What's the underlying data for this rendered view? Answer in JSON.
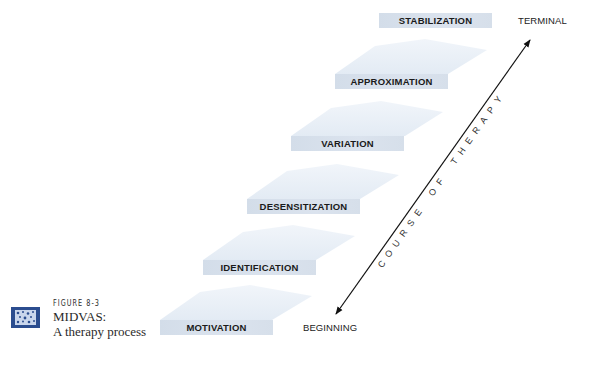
{
  "figure": {
    "number": "FIGURE 8-3",
    "title": "MIDVAS:",
    "subtitle": "A therapy process",
    "icon": "figure-pattern-icon"
  },
  "steps": [
    {
      "label": "MOTIVATION",
      "order": 1
    },
    {
      "label": "IDENTIFICATION",
      "order": 2
    },
    {
      "label": "DESENSITIZATION",
      "order": 3
    },
    {
      "label": "VARIATION",
      "order": 4
    },
    {
      "label": "APPROXIMATION",
      "order": 5
    },
    {
      "label": "STABILIZATION",
      "order": 6
    }
  ],
  "axis": {
    "start_label": "BEGINNING",
    "end_label": "TERMINAL",
    "label": "COURSE OF THERAPY",
    "arrow": "double-headed-diagonal-arrow"
  },
  "colors": {
    "bar": "#d6dfea",
    "roof": "#e9f0f7",
    "icon_bg": "#2b4d8f",
    "icon_pattern": "#c9d6ec",
    "text": "#1a1a1a"
  }
}
